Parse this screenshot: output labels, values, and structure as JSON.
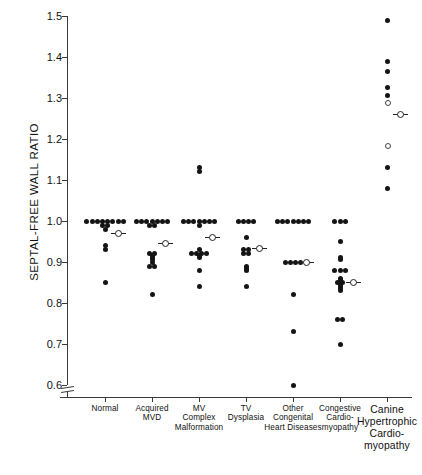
{
  "chart_data": {
    "type": "scatter",
    "title": "",
    "xlabel": "",
    "ylabel": "SEPTAL-FREE WALL RATIO",
    "ylim": [
      0.56,
      1.5
    ],
    "yticks": [
      1.5,
      1.4,
      1.3,
      1.2,
      1.1,
      1.0,
      0.9,
      0.8,
      0.7,
      0.6
    ],
    "ytick_labels": [
      "1.5",
      "1.4",
      "1.3",
      "1.2",
      "1.1",
      "1.0",
      "0.9",
      "0.8",
      "0.7",
      "0.6"
    ],
    "axis_break": true,
    "grid": false,
    "legend": "none",
    "mean_marker": "circle-with-horizontal-bar",
    "categories": [
      "Normal",
      "Acquired MVD",
      "MV Complex Malformation",
      "TV Dysplasia",
      "Other Congenital Heart Diseases",
      "Congestive Cardiomyopathy",
      "Canine Hypertrophic Cardiomyopathy"
    ],
    "groups": [
      {
        "name": "Normal",
        "label_lines": [
          "Normal"
        ],
        "x": 105,
        "mean": 0.97,
        "values": [
          1.0,
          1.0,
          1.0,
          1.0,
          1.0,
          1.0,
          1.0,
          1.0,
          0.99,
          0.99,
          0.98,
          0.94,
          0.93,
          0.85
        ]
      },
      {
        "name": "Acquired MVD",
        "label_lines": [
          "Acquired",
          "MVD"
        ],
        "x": 152,
        "mean": 0.945,
        "values": [
          1.0,
          1.0,
          1.0,
          1.0,
          1.0,
          1.0,
          1.0,
          0.99,
          0.99,
          0.92,
          0.92,
          0.915,
          0.91,
          0.905,
          0.9,
          0.89,
          0.89,
          0.82
        ]
      },
      {
        "name": "MV Complex Malformation",
        "label_lines": [
          "MV",
          "Complex",
          "Malformation"
        ],
        "x": 199,
        "mean": 0.96,
        "values": [
          1.13,
          1.12,
          1.0,
          1.0,
          1.0,
          1.0,
          1.0,
          1.0,
          1.0,
          0.99,
          0.93,
          0.92,
          0.92,
          0.92,
          0.92,
          0.915,
          0.91,
          0.88,
          0.84
        ]
      },
      {
        "name": "TV Dysplasia",
        "label_lines": [
          "TV",
          "Dysplasia"
        ],
        "x": 246,
        "mean": 0.933,
        "values": [
          1.0,
          1.0,
          1.0,
          1.0,
          0.96,
          0.93,
          0.93,
          0.92,
          0.92,
          0.89,
          0.885,
          0.88,
          0.84
        ]
      },
      {
        "name": "Other Congenital Heart Diseases",
        "label_lines": [
          "Other",
          "Congenital",
          "Heart Diseases"
        ],
        "x": 293,
        "mean": 0.9,
        "values": [
          1.0,
          1.0,
          1.0,
          1.0,
          1.0,
          1.0,
          1.0,
          0.9,
          0.9,
          0.9,
          0.9,
          0.82,
          0.73,
          0.6
        ]
      },
      {
        "name": "Congestive Cardiomyopathy",
        "label_lines": [
          "Congestive",
          "Cardio-",
          "myopathy"
        ],
        "x": 340,
        "mean": 0.85,
        "values": [
          1.0,
          1.0,
          1.0,
          0.95,
          0.91,
          0.905,
          0.88,
          0.88,
          0.88,
          0.86,
          0.855,
          0.85,
          0.85,
          0.845,
          0.84,
          0.835,
          0.83,
          0.76,
          0.76,
          0.7
        ]
      },
      {
        "name": "Canine Hypertrophic Cardiomyopathy",
        "label_lines": [
          "Canine",
          "Hypertrophic",
          "Cardio-",
          "myopathy"
        ],
        "x": 387,
        "mean": 1.26,
        "values": [
          1.49,
          1.39,
          1.365,
          1.325,
          1.305
        ],
        "open_values": [
          1.29,
          1.185
        ],
        "low_values": [
          1.13,
          1.08
        ]
      }
    ]
  },
  "axis": {
    "y_label_text": "SEPTAL-FREE WALL RATIO"
  }
}
